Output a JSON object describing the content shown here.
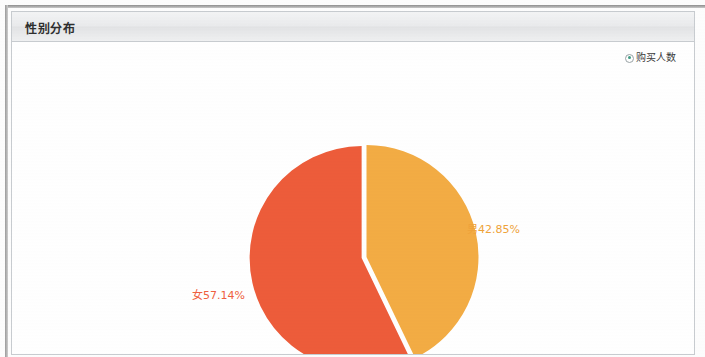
{
  "panel": {
    "title": "性别分布"
  },
  "legend": {
    "marker_icon": "radio-dot-icon",
    "marker_color": "#3f9c84",
    "label": "购买人数"
  },
  "chart_data": {
    "type": "pie",
    "title": "性别分布",
    "legend_entries": [
      "购买人数"
    ],
    "legend_position": "top-right",
    "categories": [
      "男",
      "女"
    ],
    "values": [
      42.85,
      57.14
    ],
    "unit": "%",
    "colors": [
      "#f3ac44",
      "#ed5c3a"
    ],
    "start_angle_deg": 0,
    "direction": "clockwise",
    "slices": [
      {
        "label": "男",
        "percent": 42.85,
        "display": "男42.85%",
        "color": "#f3ac44",
        "label_color": "#efa33a",
        "exploded": false
      },
      {
        "label": "女",
        "percent": 57.14,
        "display": "女57.14%",
        "color": "#ed5c3a",
        "label_color": "#ef5f40",
        "exploded": true
      }
    ],
    "grid": false,
    "xlabel": "",
    "ylabel": ""
  }
}
